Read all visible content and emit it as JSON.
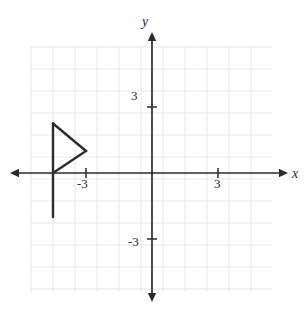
{
  "figure": {
    "kind": "coordinate-plane-figure",
    "background_color": "#ffffff",
    "grid_color": "#e7e7e9",
    "axis_color": "#2b2b2b",
    "shape_color": "#2b2b2b"
  },
  "axes": {
    "x_label": "x",
    "y_label": "y",
    "origin_px": [
      152,
      173
    ],
    "unit_px": 22,
    "x_range": [
      -5.5,
      5.5
    ],
    "y_range": [
      -5.5,
      5.5
    ],
    "grid": true,
    "grid_bounds_px": {
      "left": 31,
      "right": 272,
      "top": 47,
      "bottom": 292
    },
    "x_arrow_left_px": 10,
    "x_arrow_right_px": 288,
    "y_arrow_top_px": 32,
    "y_arrow_bottom_px": 302
  },
  "ticks": {
    "x": [
      {
        "label": "-3",
        "value": -3
      },
      {
        "label": "3",
        "value": 3
      }
    ],
    "y": [
      {
        "label": "3",
        "value": 3
      },
      {
        "label": "-3",
        "value": -3
      }
    ]
  },
  "chart_data": {
    "type": "scatter",
    "title": "",
    "xlabel": "x",
    "ylabel": "y",
    "xlim": [
      -5.5,
      5.5
    ],
    "ylim": [
      -5.5,
      5.5
    ],
    "grid": true,
    "annotations": [],
    "shapes": [
      {
        "name": "flag-pole",
        "type": "polyline",
        "closed": false,
        "points": [
          [
            -4.5,
            2.25
          ],
          [
            -4.5,
            -2
          ]
        ]
      },
      {
        "name": "flag-triangle",
        "type": "polyline",
        "closed": false,
        "points": [
          [
            -4.5,
            2.25
          ],
          [
            -3.0,
            1.0
          ],
          [
            -4.5,
            0.0
          ]
        ]
      }
    ]
  }
}
